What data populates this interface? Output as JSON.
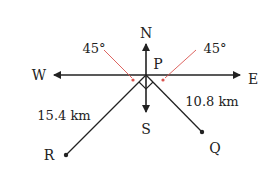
{
  "directions": {
    "north": "N",
    "south": "S",
    "east": "E",
    "west": "W"
  },
  "points": {
    "origin": "P",
    "r": "R",
    "q": "Q"
  },
  "angles": {
    "left": "45°",
    "right": "45°"
  },
  "distances": {
    "pr": "15.4 km",
    "pq": "10.8 km"
  },
  "colors": {
    "line": "#222222",
    "angle_marker": "#d9534f"
  }
}
